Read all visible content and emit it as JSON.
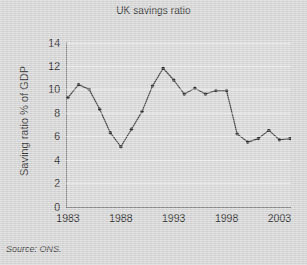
{
  "chart_data": {
    "type": "line",
    "title": "UK savings ratio",
    "xlabel": "",
    "ylabel": "Saving ratio % of GDP",
    "ylim": [
      0,
      14
    ],
    "ytick_values": [
      0,
      2,
      4,
      6,
      8,
      10,
      12,
      14
    ],
    "ytick_labels": [
      "0",
      "2",
      "4",
      "6",
      "8",
      "10",
      "12",
      "14"
    ],
    "xlim": [
      1983,
      2004
    ],
    "xtick_values": [
      1983,
      1988,
      1993,
      1998,
      2003
    ],
    "xtick_labels": [
      "1983",
      "1988",
      "1993",
      "1998",
      "2003"
    ],
    "grid": true,
    "legend": "none",
    "marker": "filled-circle",
    "line_color": "#3b3b3b",
    "marker_color": "#2a2a2a",
    "plot_background": "#d7d7d7",
    "figure_background": "#d4d4d4",
    "x": [
      1983,
      1984,
      1985,
      1986,
      1987,
      1988,
      1989,
      1990,
      1991,
      1992,
      1993,
      1994,
      1995,
      1996,
      1997,
      1998,
      1999,
      2000,
      2001,
      2002,
      2003,
      2004
    ],
    "values": [
      9.3,
      10.4,
      10.0,
      8.3,
      6.3,
      5.1,
      6.6,
      8.1,
      10.3,
      11.8,
      10.8,
      9.6,
      10.1,
      9.6,
      9.9,
      9.9,
      6.2,
      5.5,
      5.8,
      6.5,
      5.7,
      5.8
    ],
    "series": [
      {
        "name": "Saving ratio % of GDP",
        "values": [
          9.3,
          10.4,
          10.0,
          8.3,
          6.3,
          5.1,
          6.6,
          8.1,
          10.3,
          11.8,
          10.8,
          9.6,
          10.1,
          9.6,
          9.9,
          9.9,
          6.2,
          5.5,
          5.8,
          6.5,
          5.7,
          5.8
        ]
      }
    ],
    "annotations": []
  },
  "footer": {
    "source": "Source: ONS."
  }
}
